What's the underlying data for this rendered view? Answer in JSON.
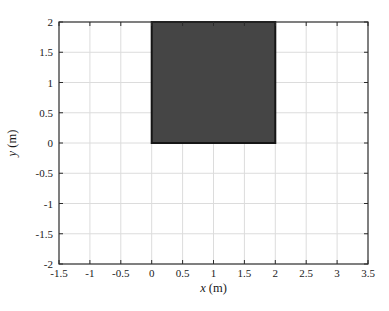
{
  "figure": {
    "width": 389,
    "height": 311,
    "background": "#ffffff"
  },
  "chart_data": {
    "type": "area",
    "title": "",
    "xlabel": "x (m)",
    "ylabel": "y (m)",
    "xlim": [
      -1.5,
      3.5
    ],
    "ylim": [
      -2,
      2
    ],
    "xticks": [
      -1.5,
      -1,
      -0.5,
      0,
      0.5,
      1,
      1.5,
      2,
      2.5,
      3,
      3.5
    ],
    "yticks": [
      -2,
      -1.5,
      -1,
      -0.5,
      0,
      0.5,
      1,
      1.5,
      2
    ],
    "grid": true,
    "legend": false,
    "box": true,
    "tick_direction": "in",
    "shapes": [
      {
        "kind": "rect",
        "name": "shaded-square",
        "x0": 0,
        "y0": 0,
        "x1": 2,
        "y1": 2,
        "fill": "#454545",
        "stroke": "#161616",
        "stroke_width": 2
      }
    ],
    "colors": {
      "grid": "#dcdcdc",
      "axis": "#2a2a2a",
      "text": "#1a1a1a"
    },
    "plot_area_px": {
      "left": 59,
      "top": 22,
      "right": 368,
      "bottom": 264
    }
  }
}
